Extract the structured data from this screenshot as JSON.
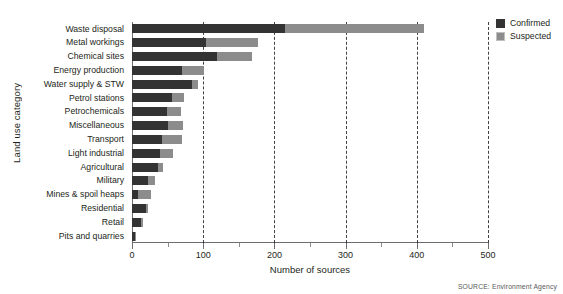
{
  "chart_data": {
    "type": "bar",
    "orientation": "horizontal",
    "stacked": true,
    "title": "",
    "xlabel": "Number of sources",
    "ylabel": "Land use category",
    "xlim": [
      0,
      500
    ],
    "xticks": [
      0,
      100,
      200,
      300,
      400,
      500
    ],
    "xtick_labels": [
      "0",
      "100",
      "200",
      "300",
      "400",
      "500"
    ],
    "xminor_ticks": [
      50,
      150,
      250,
      350,
      450
    ],
    "grid": "vertical-dashed-at-major-ticks",
    "legend_position": "top-right",
    "categories": [
      "Waste disposal",
      "Metal workings",
      "Chemical sites",
      "Energy production",
      "Water supply & STW",
      "Petrol stations",
      "Petrochemicals",
      "Miscellaneous",
      "Transport",
      "Light industrial",
      "Agricultural",
      "Military",
      "Mines & spoil heaps",
      "Residential",
      "Retail",
      "Pits and quarries"
    ],
    "series": [
      {
        "name": "Confirmed",
        "color": "#333333",
        "values": [
          215,
          104,
          120,
          70,
          84,
          56,
          49,
          50,
          42,
          39,
          37,
          23,
          8,
          20,
          13,
          4
        ]
      },
      {
        "name": "Suspected",
        "color": "#8c8c8c",
        "values": [
          195,
          73,
          49,
          31,
          9,
          17,
          20,
          22,
          28,
          18,
          7,
          9,
          19,
          2,
          2,
          1
        ]
      }
    ],
    "totals": [
      410,
      177,
      169,
      101,
      93,
      73,
      69,
      72,
      70,
      57,
      44,
      32,
      27,
      22,
      15,
      5
    ],
    "source": "SOURCE: Environment Agency"
  },
  "legend": {
    "items": [
      {
        "label": "Confirmed",
        "swatch": "confirmed-swatch"
      },
      {
        "label": "Suspected",
        "swatch": "suspected-swatch"
      }
    ]
  }
}
